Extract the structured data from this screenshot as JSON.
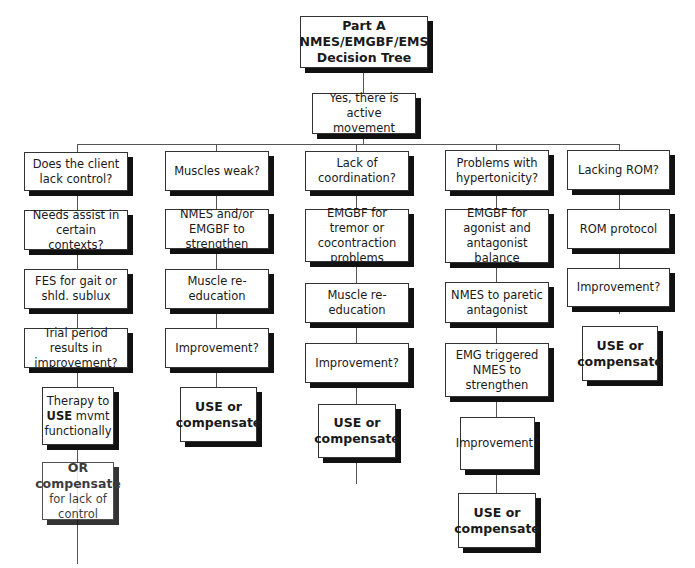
{
  "title": {
    "line1": "Part A",
    "line2": "NMES/EMGBF/EMS",
    "line3": "Decision Tree"
  },
  "root": "Yes, there is active movement",
  "columns": [
    {
      "nodes": [
        "Does the client lack control?",
        "Needs assist in certain contexts?",
        "FES for gait or shld. sublux",
        "Trial period results in improvement?"
      ],
      "therapy": {
        "before": "Therapy to",
        "keyword": "USE",
        "after": "mvmt functionally"
      },
      "compensate": {
        "line1": "OR",
        "line2": "compensate",
        "line3": "for lack of control"
      }
    },
    {
      "nodes": [
        "Muscles weak?",
        "NMES and/or EMGBF to strengthen",
        "Muscle re-education",
        "Improvement?"
      ],
      "outcome": "USE or compensate"
    },
    {
      "nodes": [
        "Lack of coordination?",
        "EMGBF for tremor or cocontraction problems",
        "Muscle re-education",
        "Improvement?"
      ],
      "outcome": "USE or compensate"
    },
    {
      "nodes": [
        "Problems with hypertonicity?",
        "EMGBF for agonist and antagonist balance",
        "NMES to paretic antagonist",
        "EMG triggered NMES to strengthen",
        "Improvement?"
      ],
      "outcome": "USE or compensate"
    },
    {
      "nodes": [
        "Lacking ROM?",
        "ROM protocol",
        "Improvement?"
      ],
      "outcome": "USE or compensate"
    }
  ]
}
